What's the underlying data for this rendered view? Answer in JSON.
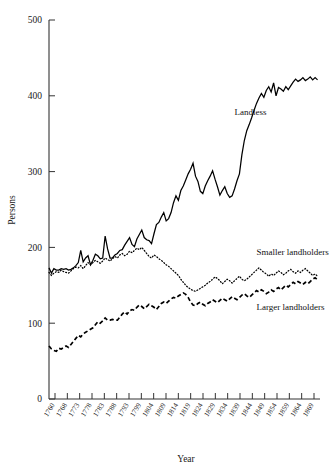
{
  "chart_data": {
    "type": "line",
    "title": "",
    "xlabel": "Year",
    "ylabel": "Persons",
    "xlim": [
      1760,
      1871
    ],
    "ylim": [
      0,
      500
    ],
    "yticks": [
      0,
      100,
      200,
      300,
      400,
      500
    ],
    "ytick_labels": [
      "0",
      "100",
      "200",
      "300",
      "400",
      "500"
    ],
    "xtick_labels": [
      "1760",
      "1768",
      "1773",
      "1778",
      "1783",
      "1788",
      "1793",
      "1799",
      "1804",
      "1809",
      "1814",
      "1819",
      "1824",
      "1829",
      "1834",
      "1839",
      "1844",
      "1849",
      "1854",
      "1859",
      "1864",
      "1869"
    ],
    "grid": false,
    "legend_position": "inline-annotations",
    "annotations": [
      {
        "text": "Landless",
        "x": 1836,
        "y": 375
      },
      {
        "text": "Smaller landholders",
        "x": 1845,
        "y": 190
      },
      {
        "text": "Larger landholders",
        "x": 1845,
        "y": 117
      }
    ],
    "series": [
      {
        "name": "Landless",
        "style": "solid",
        "color": "#000000",
        "x": [
          1760,
          1761,
          1762,
          1763,
          1764,
          1765,
          1766,
          1767,
          1768,
          1769,
          1770,
          1771,
          1772,
          1773,
          1774,
          1775,
          1776,
          1777,
          1778,
          1779,
          1780,
          1781,
          1782,
          1783,
          1784,
          1785,
          1786,
          1787,
          1788,
          1789,
          1790,
          1791,
          1792,
          1793,
          1794,
          1795,
          1796,
          1797,
          1798,
          1799,
          1800,
          1801,
          1802,
          1803,
          1804,
          1805,
          1806,
          1807,
          1808,
          1809,
          1810,
          1811,
          1812,
          1813,
          1814,
          1815,
          1816,
          1817,
          1818,
          1819,
          1820,
          1821,
          1822,
          1823,
          1824,
          1825,
          1826,
          1827,
          1828,
          1829,
          1830,
          1831,
          1832,
          1833,
          1834,
          1835,
          1836,
          1837,
          1838,
          1839,
          1840,
          1841,
          1842,
          1843,
          1844,
          1845,
          1846,
          1847,
          1848,
          1849,
          1850,
          1851,
          1852,
          1853,
          1854,
          1855,
          1856,
          1857,
          1858,
          1859,
          1860,
          1861,
          1862,
          1863,
          1864,
          1865,
          1866,
          1867,
          1868,
          1869,
          1870
        ],
        "values": [
          173,
          166,
          172,
          170,
          170,
          172,
          171,
          172,
          170,
          171,
          173,
          176,
          180,
          196,
          181,
          186,
          189,
          177,
          183,
          191,
          189,
          185,
          186,
          215,
          198,
          186,
          186,
          190,
          192,
          196,
          197,
          203,
          208,
          213,
          204,
          201,
          211,
          217,
          223,
          213,
          210,
          209,
          205,
          218,
          230,
          233,
          240,
          246,
          235,
          238,
          246,
          259,
          268,
          262,
          275,
          281,
          289,
          297,
          303,
          311,
          294,
          287,
          274,
          271,
          281,
          288,
          294,
          301,
          290,
          280,
          269,
          275,
          280,
          271,
          266,
          268,
          277,
          288,
          297,
          322,
          341,
          354,
          362,
          371,
          381,
          390,
          397,
          403,
          398,
          407,
          412,
          405,
          417,
          400,
          411,
          409,
          406,
          412,
          408,
          413,
          418,
          422,
          419,
          421,
          424,
          420,
          422,
          425,
          421,
          424,
          421
        ]
      },
      {
        "name": "Smaller landholders",
        "style": "dotted",
        "color": "#000000",
        "x": [
          1760,
          1761,
          1762,
          1763,
          1764,
          1765,
          1766,
          1767,
          1768,
          1769,
          1770,
          1771,
          1772,
          1773,
          1774,
          1775,
          1776,
          1777,
          1778,
          1779,
          1780,
          1781,
          1782,
          1783,
          1784,
          1785,
          1786,
          1787,
          1788,
          1789,
          1790,
          1791,
          1792,
          1793,
          1794,
          1795,
          1796,
          1797,
          1798,
          1799,
          1800,
          1801,
          1802,
          1803,
          1804,
          1805,
          1806,
          1807,
          1808,
          1809,
          1810,
          1811,
          1812,
          1813,
          1814,
          1815,
          1816,
          1817,
          1818,
          1819,
          1820,
          1821,
          1822,
          1823,
          1824,
          1825,
          1826,
          1827,
          1828,
          1829,
          1830,
          1831,
          1832,
          1833,
          1834,
          1835,
          1836,
          1837,
          1838,
          1839,
          1840,
          1841,
          1842,
          1843,
          1844,
          1845,
          1846,
          1847,
          1848,
          1849,
          1850,
          1851,
          1852,
          1853,
          1854,
          1855,
          1856,
          1857,
          1858,
          1859,
          1860,
          1861,
          1862,
          1863,
          1864,
          1865,
          1866,
          1867,
          1868,
          1869,
          1870
        ],
        "values": [
          167,
          163,
          166,
          168,
          167,
          170,
          168,
          167,
          166,
          169,
          172,
          174,
          173,
          176,
          172,
          176,
          180,
          177,
          180,
          183,
          181,
          179,
          182,
          186,
          184,
          182,
          185,
          188,
          186,
          190,
          192,
          189,
          191,
          195,
          193,
          196,
          199,
          197,
          200,
          196,
          192,
          188,
          186,
          190,
          188,
          185,
          183,
          180,
          177,
          175,
          172,
          169,
          166,
          163,
          158,
          154,
          150,
          147,
          145,
          143,
          142,
          144,
          146,
          148,
          150,
          153,
          155,
          158,
          161,
          159,
          156,
          152,
          155,
          158,
          156,
          153,
          156,
          159,
          162,
          158,
          156,
          158,
          161,
          164,
          167,
          170,
          173,
          170,
          167,
          165,
          162,
          165,
          163,
          166,
          169,
          167,
          164,
          166,
          169,
          171,
          168,
          166,
          169,
          167,
          170,
          172,
          169,
          166,
          163,
          165,
          162
        ]
      },
      {
        "name": "Larger landholders",
        "style": "dashed",
        "color": "#000000",
        "x": [
          1760,
          1761,
          1762,
          1763,
          1764,
          1765,
          1766,
          1767,
          1768,
          1769,
          1770,
          1771,
          1772,
          1773,
          1774,
          1775,
          1776,
          1777,
          1778,
          1779,
          1780,
          1781,
          1782,
          1783,
          1784,
          1785,
          1786,
          1787,
          1788,
          1789,
          1790,
          1791,
          1792,
          1793,
          1794,
          1795,
          1796,
          1797,
          1798,
          1799,
          1800,
          1801,
          1802,
          1803,
          1804,
          1805,
          1806,
          1807,
          1808,
          1809,
          1810,
          1811,
          1812,
          1813,
          1814,
          1815,
          1816,
          1817,
          1818,
          1819,
          1820,
          1821,
          1822,
          1823,
          1824,
          1825,
          1826,
          1827,
          1828,
          1829,
          1830,
          1831,
          1832,
          1833,
          1834,
          1835,
          1836,
          1837,
          1838,
          1839,
          1840,
          1841,
          1842,
          1843,
          1844,
          1845,
          1846,
          1847,
          1848,
          1849,
          1850,
          1851,
          1852,
          1853,
          1854,
          1855,
          1856,
          1857,
          1858,
          1859,
          1860,
          1861,
          1862,
          1863,
          1864,
          1865,
          1866,
          1867,
          1868,
          1869,
          1870
        ],
        "values": [
          70,
          66,
          64,
          63,
          67,
          66,
          68,
          70,
          68,
          72,
          76,
          80,
          84,
          82,
          86,
          88,
          90,
          92,
          94,
          98,
          102,
          100,
          103,
          107,
          104,
          104,
          105,
          104,
          104,
          108,
          112,
          115,
          112,
          116,
          118,
          117,
          121,
          124,
          122,
          119,
          122,
          125,
          123,
          121,
          118,
          122,
          126,
          128,
          126,
          129,
          132,
          134,
          133,
          136,
          138,
          140,
          138,
          134,
          128,
          124,
          123,
          126,
          128,
          125,
          123,
          126,
          128,
          131,
          129,
          127,
          130,
          133,
          131,
          129,
          132,
          135,
          133,
          131,
          134,
          137,
          139,
          136,
          134,
          137,
          140,
          143,
          141,
          144,
          142,
          139,
          141,
          144,
          142,
          145,
          147,
          144,
          147,
          150,
          148,
          151,
          154,
          152,
          155,
          153,
          151,
          154,
          152,
          155,
          158,
          160,
          157
        ]
      }
    ]
  },
  "axis": {
    "ylabel": "Persons",
    "xlabel": "Year"
  }
}
